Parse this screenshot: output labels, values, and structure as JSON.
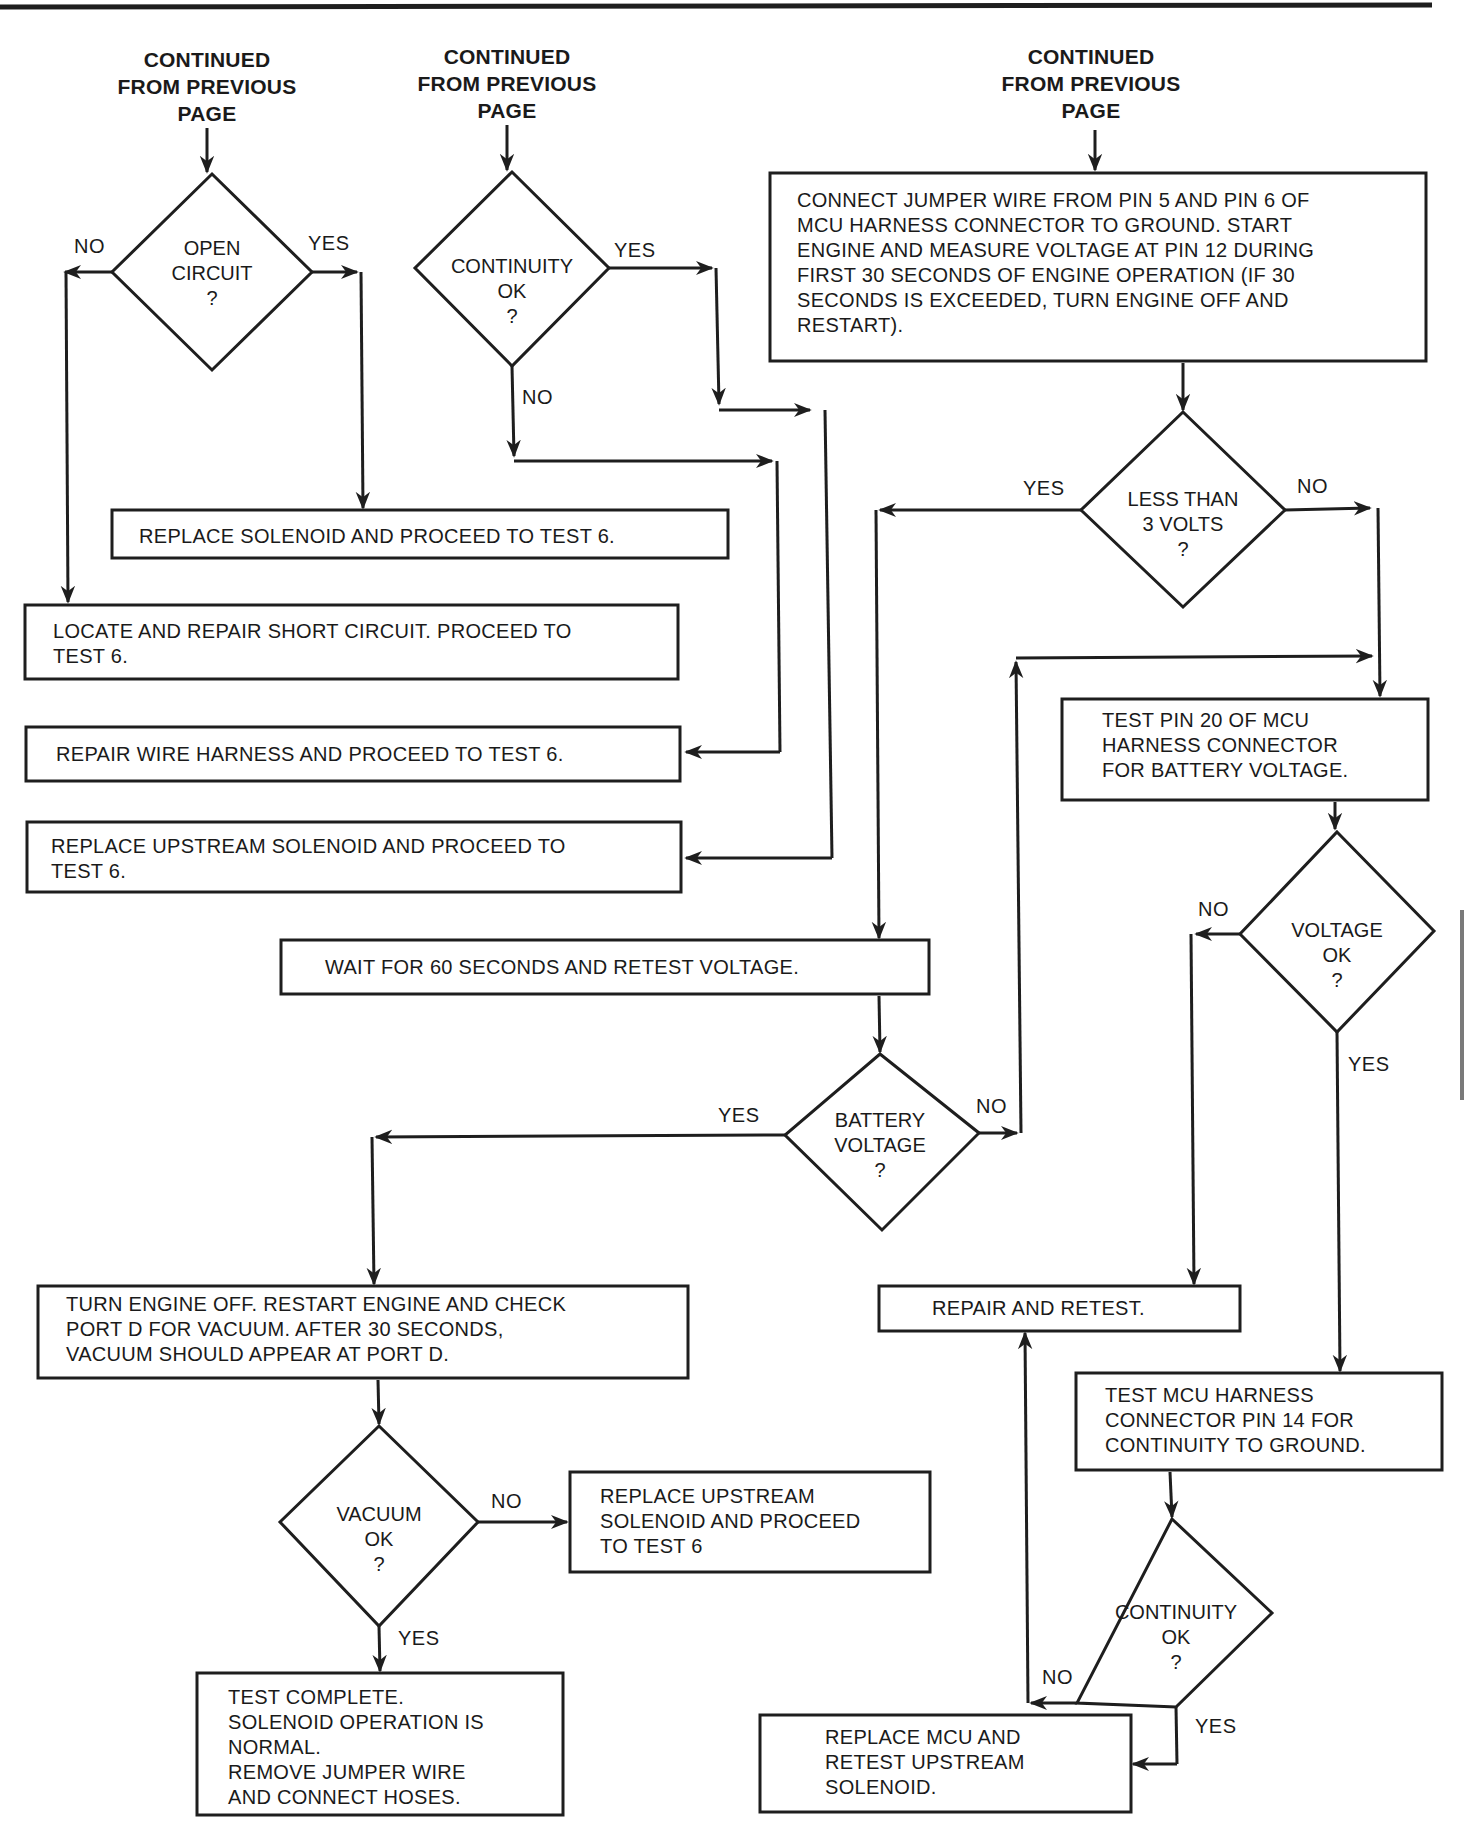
{
  "headers": [
    {
      "id": "col1",
      "text": "CONTINUED\nFROM PREVIOUS\nPAGE"
    },
    {
      "id": "col2",
      "text": "CONTINUED\nFROM PREVIOUS\nPAGE"
    },
    {
      "id": "col3",
      "text": "CONTINUED\nFROM PREVIOUS\nPAGE"
    }
  ],
  "decisions": {
    "open_circuit": "OPEN\nCIRCUIT\n?",
    "continuity_top": "CONTINUITY\nOK\n?",
    "less_than_3v": "LESS THAN\n3 VOLTS\n?",
    "voltage_ok": "VOLTAGE\nOK\n?",
    "battery_voltage": "BATTERY\nVOLTAGE\n?",
    "vacuum_ok": "VACUUM\nOK\n?",
    "continuity_bottom": "CONTINUITY\nOK\n?"
  },
  "steps": {
    "connect_jumper": "CONNECT JUMPER WIRE FROM PIN 5 AND PIN 6 OF\nMCU HARNESS CONNECTOR TO GROUND. START\nENGINE AND MEASURE VOLTAGE AT PIN 12 DURING\nFIRST 30 SECONDS OF ENGINE OPERATION (IF 30\nSECONDS IS EXCEEDED, TURN ENGINE OFF AND\nRESTART).",
    "replace_solenoid": "REPLACE SOLENOID AND PROCEED TO TEST 6.",
    "locate_short": "LOCATE AND REPAIR SHORT CIRCUIT. PROCEED TO\nTEST 6.",
    "repair_harness": "REPAIR WIRE HARNESS AND PROCEED TO TEST 6.",
    "replace_upstream_1": "REPLACE UPSTREAM SOLENOID AND PROCEED TO\nTEST 6.",
    "test_pin20": "TEST PIN 20 OF MCU\nHARNESS CONNECTOR\nFOR BATTERY VOLTAGE.",
    "wait_60": "WAIT FOR 60 SECONDS AND RETEST VOLTAGE.",
    "turn_engine_off": "TURN ENGINE OFF. RESTART ENGINE AND CHECK\nPORT D FOR VACUUM. AFTER 30 SECONDS,\nVACUUM SHOULD APPEAR AT PORT D.",
    "repair_retest": "REPAIR AND RETEST.",
    "test_pin14": "TEST MCU HARNESS\nCONNECTOR PIN 14 FOR\nCONTINUITY TO GROUND.",
    "replace_upstream_2": "REPLACE UPSTREAM\nSOLENOID AND PROCEED\nTO TEST 6",
    "test_complete": "TEST COMPLETE.\nSOLENOID OPERATION IS\nNORMAL.\nREMOVE JUMPER WIRE\nAND CONNECT HOSES.",
    "replace_mcu": "REPLACE MCU AND\nRETEST UPSTREAM\nSOLENOID."
  },
  "labels": {
    "open_no": "NO",
    "open_yes": "YES",
    "cont_top_yes": "YES",
    "cont_top_no": "NO",
    "less3_yes": "YES",
    "less3_no": "NO",
    "volt_no": "NO",
    "volt_yes": "YES",
    "batt_yes": "YES",
    "batt_no": "NO",
    "vac_no": "NO",
    "vac_yes": "YES",
    "cont_bot_no": "NO",
    "cont_bot_yes": "YES"
  },
  "colors": {
    "ink": "#1e1e1e",
    "paper": "#ffffff",
    "edge_tab": "#7a7a7a"
  }
}
